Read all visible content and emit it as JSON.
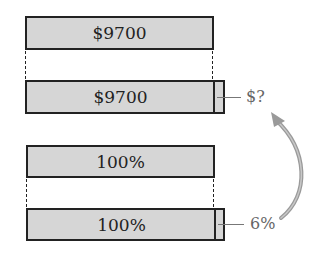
{
  "diagram": {
    "type": "bar-model",
    "colors": {
      "bar_fill": "#d6d6d6",
      "bar_border": "#222222",
      "annotation": "#777777",
      "arrow": "#9a9a9a"
    },
    "top_group": {
      "original_bar": {
        "label": "$9700"
      },
      "increased_bar": {
        "label": "$9700",
        "extra_label": "$?"
      }
    },
    "bottom_group": {
      "original_bar": {
        "label": "100%"
      },
      "increased_bar": {
        "label": "100%",
        "extra_label": "6%"
      }
    },
    "arrow": {
      "from": "6%",
      "to": "$?",
      "meaning": "percent maps to dollar amount"
    }
  }
}
